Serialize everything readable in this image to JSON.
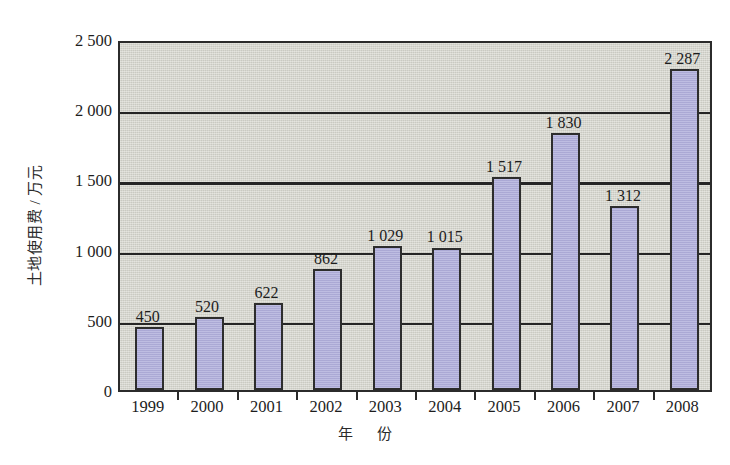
{
  "chart_data": {
    "type": "bar",
    "title": "",
    "subtitle": "",
    "xlabel": "年 份",
    "ylabel": "土地使用费 / 万元",
    "categories": [
      "1999",
      "2000",
      "2001",
      "2002",
      "2003",
      "2004",
      "2005",
      "2006",
      "2007",
      "2008"
    ],
    "values": [
      450,
      520,
      622,
      862,
      1029,
      1015,
      1517,
      1830,
      1312,
      2287
    ],
    "value_labels": [
      "450",
      "520",
      "622",
      "862",
      "1 029",
      "1 015",
      "1 517",
      "1 830",
      "1 312",
      "2 287"
    ],
    "ylim": [
      0,
      2500
    ],
    "y_ticks": [
      0,
      500,
      1000,
      1500,
      2000,
      2500
    ],
    "y_tick_labels": [
      "0",
      "500",
      "1 000",
      "1 500",
      "2 000",
      "2 500"
    ],
    "grid": true,
    "gridlines_at": [
      500,
      1000,
      1500,
      2000
    ],
    "legend": "none",
    "bar_fill_color": "#b2b0dc",
    "bar_edge_color": "#2d2d2d",
    "plot_background_color": "#d4d4cb",
    "axis_color": "#2b2b2b",
    "page_background_color": "#ffffff"
  }
}
